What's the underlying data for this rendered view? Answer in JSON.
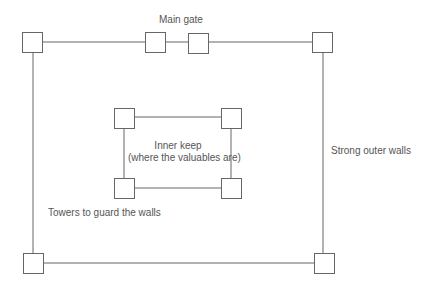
{
  "diagram": {
    "colors": {
      "line": "#666666",
      "text": "#555555",
      "background": "#ffffff"
    },
    "labels": {
      "main_gate": "Main gate",
      "inner_keep_line1": "Inner keep",
      "inner_keep_line2": "(where the valuables are)",
      "outer_walls": "Strong outer walls",
      "towers": "Towers to guard the walls"
    },
    "outer_towers": [
      "top-left",
      "gate-left",
      "gate-right",
      "top-right",
      "bottom-left",
      "bottom-right"
    ],
    "inner_towers": [
      "top-left",
      "top-right",
      "bottom-left",
      "bottom-right"
    ]
  }
}
